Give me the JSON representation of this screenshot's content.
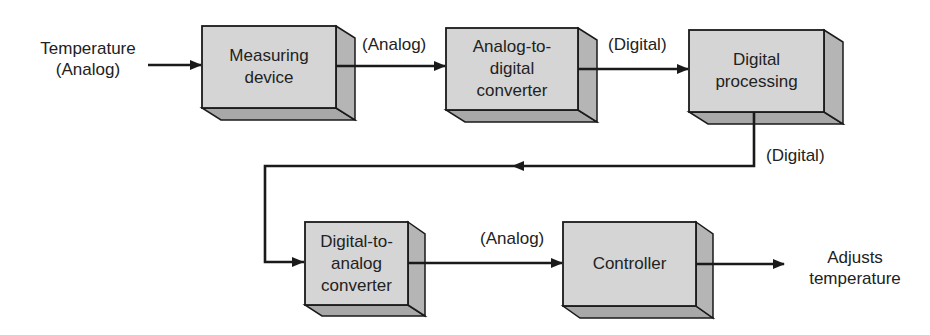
{
  "diagram": {
    "type": "block-diagram",
    "colors": {
      "box_front": "#d4d4d4",
      "box_side": "#b3b3b3",
      "box_bottom": "#a6a6a6",
      "stroke": "#1a1a1a",
      "background": "#ffffff"
    },
    "input": {
      "line1": "Temperature",
      "line2": "(Analog)"
    },
    "output": {
      "line1": "Adjusts",
      "line2": "temperature"
    },
    "blocks": [
      {
        "id": "measuring-device",
        "lines": [
          "Measuring",
          "device"
        ]
      },
      {
        "id": "adc",
        "lines": [
          "Analog-to-",
          "digital",
          "converter"
        ]
      },
      {
        "id": "digital-processing",
        "lines": [
          "Digital",
          "processing"
        ]
      },
      {
        "id": "dac",
        "lines": [
          "Digital-to-",
          "analog",
          "converter"
        ]
      },
      {
        "id": "controller",
        "lines": [
          "Controller"
        ]
      }
    ],
    "edge_labels": {
      "measuring_to_adc": "(Analog)",
      "adc_to_processing": "(Digital)",
      "processing_to_dac": "(Digital)",
      "dac_to_controller": "(Analog)"
    }
  }
}
